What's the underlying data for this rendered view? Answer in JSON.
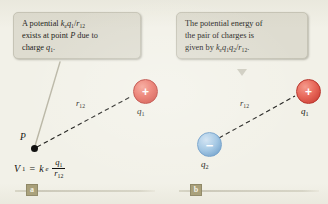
{
  "figure": {
    "background_color": "#f2f1e8",
    "panels": [
      {
        "badge": "a",
        "callout": {
          "line1_pre": "A potential ",
          "line1_k": "k",
          "line1_k_sub": "e",
          "line1_q": "q",
          "line1_q_sub": "1",
          "line1_slash": "/",
          "line1_r": "r",
          "line1_r_sub": "12",
          "line2": "exists at point ",
          "line2_P": "P",
          "line2_tail": " due to",
          "line3_pre": "charge ",
          "line3_q": "q",
          "line3_q_sub": "1",
          "line3_period": "."
        },
        "point_label": "P",
        "distance_label_r": "r",
        "distance_label_sub": "12",
        "charges": [
          {
            "name": "q1",
            "sign": "+",
            "label_base": "q",
            "label_sub": "1",
            "color": "#d7493c"
          }
        ],
        "equation": {
          "V": "V",
          "V_sub": "1",
          "equals": "=",
          "k": "k",
          "k_sub": "e",
          "numerator": "q",
          "numerator_sub": "1",
          "denominator": "r",
          "denominator_sub": "12"
        }
      },
      {
        "badge": "b",
        "callout": {
          "line1": "The potential energy of",
          "line2": "the pair of charges is",
          "line3_pre": "given by ",
          "line3_k": "k",
          "line3_k_sub": "e",
          "line3_q1": "q",
          "line3_q1_sub": "1",
          "line3_q2": "q",
          "line3_q2_sub": "2",
          "line3_slash": "/",
          "line3_r": "r",
          "line3_r_sub": "12",
          "line3_period": "."
        },
        "distance_label_r": "r",
        "distance_label_sub": "12",
        "charges": [
          {
            "name": "q1",
            "sign": "+",
            "label_base": "q",
            "label_sub": "1",
            "color": "#d7493c"
          },
          {
            "name": "q2",
            "sign": "−",
            "label_base": "q",
            "label_sub": "2",
            "color": "#8bb6da"
          }
        ]
      }
    ]
  }
}
